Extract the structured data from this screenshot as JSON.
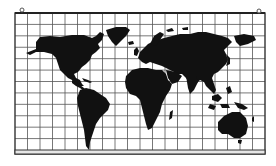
{
  "map": {
    "title": "World map on grid",
    "projection": "equirectangular",
    "grid": {
      "columns": 20,
      "rows": 12
    },
    "colors": {
      "land": "#111111",
      "grid": "#555555",
      "frame": "#333333",
      "background": "#ffffff",
      "rail": "#e6e6e6"
    },
    "continents": [
      "north-america",
      "greenland",
      "south-america",
      "europe",
      "africa",
      "asia",
      "australia",
      "madagascar",
      "japan",
      "indonesia",
      "new-guinea",
      "uk",
      "iceland",
      "new-zealand"
    ],
    "mounting": [
      "left-hook",
      "right-hook"
    ]
  }
}
